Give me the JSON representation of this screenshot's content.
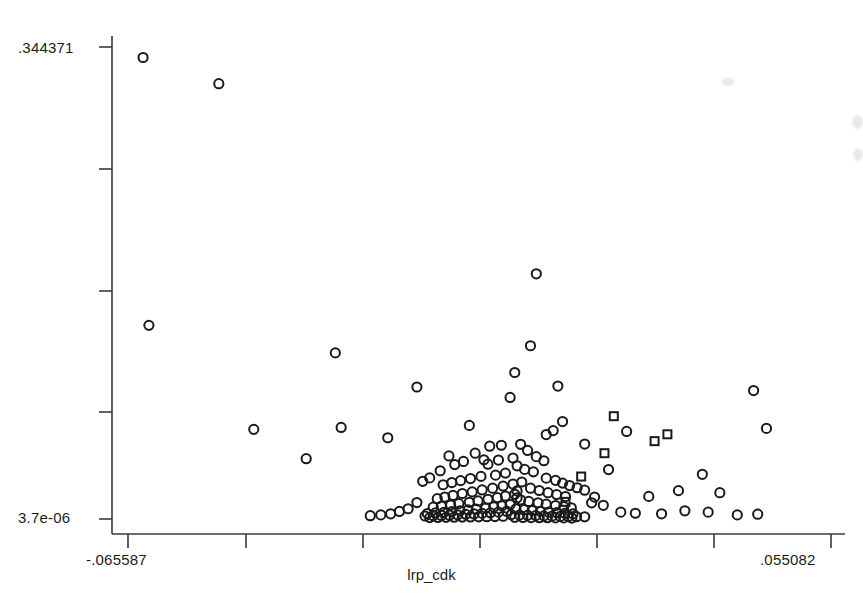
{
  "chart_data": {
    "type": "scatter",
    "title": "",
    "xlabel": "lrp_cdk",
    "ylabel": "",
    "xlim": [
      -0.065587,
      0.055082
    ],
    "ylim": [
      3.7e-06,
      0.344371
    ],
    "grid": false,
    "legend": "none",
    "x_tick_labels": [
      "-.065587",
      ".055082"
    ],
    "y_tick_labels": [
      ".344371",
      "3.7e-06"
    ],
    "x_tick_positions": [
      -0.065587,
      0.055082
    ],
    "y_tick_positions": [
      3.7e-06,
      0.344371
    ],
    "n_y_ticks": 5,
    "n_x_ticks": 7,
    "marker_color": "#1a1a1a",
    "series": [
      {
        "name": "circles",
        "marker": "circle",
        "points": [
          [
            -0.063,
            0.3367
          ],
          [
            -0.05,
            0.3176
          ],
          [
            -0.062,
            0.1413
          ],
          [
            -0.03,
            0.1212
          ],
          [
            -0.016,
            0.0963
          ],
          [
            -0.007,
            0.0683
          ],
          [
            -0.044,
            0.0654
          ],
          [
            -0.021,
            0.0593
          ],
          [
            -0.029,
            0.0668
          ],
          [
            -0.035,
            0.044
          ],
          [
            0.0045,
            0.1789
          ],
          [
            0.0008,
            0.1069
          ],
          [
            0.0,
            0.0887
          ],
          [
            0.0035,
            0.1264
          ],
          [
            0.0082,
            0.097
          ],
          [
            0.009,
            0.0711
          ],
          [
            0.0074,
            0.0645
          ],
          [
            0.0062,
            0.0616
          ],
          [
            0.0418,
            0.0937
          ],
          [
            0.044,
            0.0661
          ],
          [
            0.02,
            0.0639
          ],
          [
            0.0128,
            0.0547
          ],
          [
            0.0169,
            0.0361
          ],
          [
            0.033,
            0.0326
          ],
          [
            0.0289,
            0.0207
          ],
          [
            0.036,
            0.0192
          ],
          [
            0.0238,
            0.0165
          ],
          [
            -0.0015,
            0.0538
          ],
          [
            -0.0035,
            0.0531
          ],
          [
            0.0018,
            0.0545
          ],
          [
            -0.006,
            0.048
          ],
          [
            -0.0045,
            0.0432
          ],
          [
            -0.008,
            0.042
          ],
          [
            -0.0095,
            0.0397
          ],
          [
            -0.0105,
            0.046
          ],
          [
            -0.012,
            0.0352
          ],
          [
            -0.0138,
            0.03
          ],
          [
            -0.015,
            0.0275
          ],
          [
            0.003,
            0.05
          ],
          [
            0.0045,
            0.0455
          ],
          [
            0.0058,
            0.0425
          ],
          [
            0.0005,
            0.0445
          ],
          [
            -0.002,
            0.043
          ],
          [
            -0.0038,
            0.04
          ],
          [
            0.0012,
            0.0388
          ],
          [
            0.0025,
            0.0362
          ],
          [
            0.004,
            0.0344
          ],
          [
            -0.0008,
            0.0335
          ],
          [
            -0.0025,
            0.032
          ],
          [
            -0.005,
            0.0311
          ],
          [
            -0.0068,
            0.0295
          ],
          [
            -0.0085,
            0.028
          ],
          [
            -0.01,
            0.0266
          ],
          [
            -0.0115,
            0.025
          ],
          [
            0.0062,
            0.0298
          ],
          [
            0.0078,
            0.0282
          ],
          [
            0.009,
            0.0262
          ],
          [
            0.0102,
            0.0244
          ],
          [
            0.0115,
            0.0228
          ],
          [
            0.0128,
            0.021
          ],
          [
            0.002,
            0.027
          ],
          [
            0.0005,
            0.0255
          ],
          [
            -0.0012,
            0.024
          ],
          [
            -0.003,
            0.0225
          ],
          [
            -0.0048,
            0.0212
          ],
          [
            -0.0065,
            0.0198
          ],
          [
            -0.0082,
            0.0186
          ],
          [
            -0.0098,
            0.0172
          ],
          [
            -0.0112,
            0.016
          ],
          [
            -0.0125,
            0.0148
          ],
          [
            0.0035,
            0.0225
          ],
          [
            0.005,
            0.0208
          ],
          [
            0.0065,
            0.0192
          ],
          [
            0.008,
            0.0178
          ],
          [
            0.0095,
            0.0164
          ],
          [
            0.0008,
            0.018
          ],
          [
            -0.0008,
            0.0168
          ],
          [
            -0.0022,
            0.0156
          ],
          [
            -0.0038,
            0.0144
          ],
          [
            -0.0055,
            0.0132
          ],
          [
            -0.007,
            0.0122
          ],
          [
            -0.0088,
            0.0112
          ],
          [
            -0.0102,
            0.0102
          ],
          [
            -0.0118,
            0.0094
          ],
          [
            -0.0132,
            0.0086
          ],
          [
            0.0018,
            0.014
          ],
          [
            0.0032,
            0.0128
          ],
          [
            0.0048,
            0.0118
          ],
          [
            0.0062,
            0.0108
          ],
          [
            0.0078,
            0.0098
          ],
          [
            0.0092,
            0.009
          ],
          [
            0.0105,
            0.0082
          ],
          [
            0.0,
            0.0106
          ],
          [
            -0.0014,
            0.0096
          ],
          [
            -0.0028,
            0.0088
          ],
          [
            -0.0042,
            0.008
          ],
          [
            -0.0058,
            0.0072
          ],
          [
            -0.0072,
            0.0066
          ],
          [
            -0.0086,
            0.006
          ],
          [
            -0.01,
            0.0054
          ],
          [
            -0.0114,
            0.0048
          ],
          [
            -0.0128,
            0.0044
          ],
          [
            -0.0142,
            0.004
          ],
          [
            0.001,
            0.0074
          ],
          [
            0.0024,
            0.0068
          ],
          [
            0.0038,
            0.0062
          ],
          [
            0.0052,
            0.0056
          ],
          [
            0.0066,
            0.005
          ],
          [
            0.008,
            0.0046
          ],
          [
            0.0094,
            0.0042
          ],
          [
            0.0108,
            0.0038
          ],
          [
            -0.0006,
            0.0056
          ],
          [
            -0.002,
            0.005
          ],
          [
            -0.0034,
            0.0045
          ],
          [
            -0.0048,
            0.0041
          ],
          [
            -0.0062,
            0.0037
          ],
          [
            -0.0076,
            0.0034
          ],
          [
            -0.009,
            0.0031
          ],
          [
            -0.0104,
            0.0028
          ],
          [
            -0.0118,
            0.0026
          ],
          [
            -0.0132,
            0.0024
          ],
          [
            -0.0146,
            0.0022
          ],
          [
            0.0002,
            0.0032
          ],
          [
            0.0016,
            0.0029
          ],
          [
            0.003,
            0.0027
          ],
          [
            0.0044,
            0.0025
          ],
          [
            0.0058,
            0.0023
          ],
          [
            0.0072,
            0.0021
          ],
          [
            0.0086,
            0.0019
          ],
          [
            0.01,
            0.0018
          ],
          [
            0.0114,
            0.0017
          ],
          [
            0.0128,
            0.0016
          ],
          [
            -0.0012,
            0.002
          ],
          [
            -0.0026,
            0.0018
          ],
          [
            -0.004,
            0.0017
          ],
          [
            -0.0054,
            0.0016
          ],
          [
            -0.0068,
            0.0015
          ],
          [
            -0.0082,
            0.0014
          ],
          [
            -0.0096,
            0.0013
          ],
          [
            -0.011,
            0.0012
          ],
          [
            -0.0124,
            0.0011
          ],
          [
            -0.0138,
            0.001
          ],
          [
            0.0008,
            0.0012
          ],
          [
            0.0022,
            0.0011
          ],
          [
            0.0036,
            0.001
          ],
          [
            0.005,
            0.0009
          ],
          [
            0.0064,
            0.0009
          ],
          [
            0.0078,
            0.0008
          ],
          [
            0.0092,
            0.0008
          ],
          [
            0.0106,
            0.0007
          ],
          [
            0.0145,
            0.016
          ],
          [
            0.016,
            0.01
          ],
          [
            0.019,
            0.005
          ],
          [
            0.0215,
            0.0042
          ],
          [
            0.026,
            0.0038
          ],
          [
            0.03,
            0.006
          ],
          [
            0.034,
            0.005
          ],
          [
            0.039,
            0.003
          ],
          [
            0.0425,
            0.0035
          ],
          [
            -0.016,
            0.012
          ],
          [
            -0.0175,
            0.0075
          ],
          [
            -0.019,
            0.0055
          ],
          [
            -0.0205,
            0.0038
          ],
          [
            -0.0222,
            0.003
          ],
          [
            -0.024,
            0.0024
          ],
          [
            0.0012,
            0.0205
          ],
          [
            0.0012,
            0.0155
          ],
          [
            0.014,
            0.0118
          ]
        ]
      },
      {
        "name": "squares",
        "marker": "square",
        "points": [
          [
            0.0178,
            0.075
          ],
          [
            0.027,
            0.0618
          ],
          [
            0.0248,
            0.0568
          ],
          [
            0.0162,
            0.048
          ],
          [
            0.0122,
            0.031
          ],
          [
            0.0095,
            0.0125
          ]
        ]
      }
    ]
  },
  "axes": {
    "y_max_label": ".344371",
    "y_min_label": "3.7e-06",
    "x_min_label": "-.065587",
    "x_max_label": ".055082",
    "x_title": "lrp_cdk"
  }
}
